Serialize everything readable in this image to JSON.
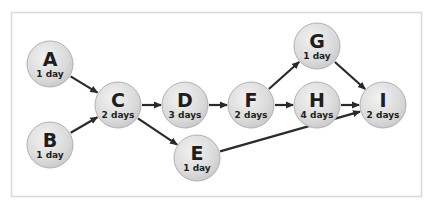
{
  "diagram": {
    "type": "activity-network",
    "frame_color": "#d9d9d9",
    "node_fill": "#dcdcdc",
    "node_stroke": "#b0b0b0",
    "arrow_color": "#2a2a2a",
    "nodes": [
      {
        "id": "A",
        "label": "A",
        "duration": "1 day",
        "x": 50,
        "y": 64
      },
      {
        "id": "B",
        "label": "B",
        "duration": "1 day",
        "x": 50,
        "y": 145
      },
      {
        "id": "C",
        "label": "C",
        "duration": "2 days",
        "x": 118,
        "y": 105
      },
      {
        "id": "D",
        "label": "D",
        "duration": "3 days",
        "x": 185,
        "y": 105
      },
      {
        "id": "E",
        "label": "E",
        "duration": "1 day",
        "x": 197,
        "y": 158
      },
      {
        "id": "F",
        "label": "F",
        "duration": "2 days",
        "x": 251,
        "y": 105
      },
      {
        "id": "G",
        "label": "G",
        "duration": "1 day",
        "x": 317,
        "y": 46
      },
      {
        "id": "H",
        "label": "H",
        "duration": "4 days",
        "x": 317,
        "y": 105
      },
      {
        "id": "I",
        "label": "I",
        "duration": "2 days",
        "x": 383,
        "y": 105
      }
    ],
    "edges": [
      {
        "from": "A",
        "to": "C"
      },
      {
        "from": "B",
        "to": "C"
      },
      {
        "from": "C",
        "to": "D"
      },
      {
        "from": "C",
        "to": "E"
      },
      {
        "from": "D",
        "to": "F"
      },
      {
        "from": "F",
        "to": "G"
      },
      {
        "from": "F",
        "to": "H"
      },
      {
        "from": "G",
        "to": "I"
      },
      {
        "from": "H",
        "to": "I"
      },
      {
        "from": "E",
        "to": "I"
      }
    ]
  }
}
